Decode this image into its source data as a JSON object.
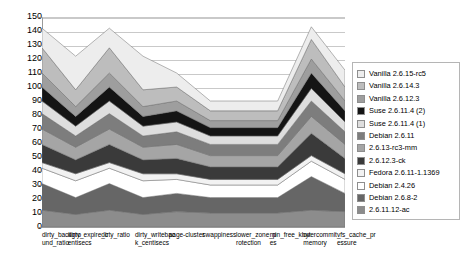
{
  "chart_data": {
    "type": "area",
    "stacked": true,
    "title": "",
    "xlabel": "",
    "ylabel": "",
    "ylim": [
      0,
      150
    ],
    "ytick_step": 10,
    "yticks": [
      0,
      10,
      20,
      30,
      40,
      50,
      60,
      70,
      80,
      90,
      100,
      110,
      120,
      130,
      140,
      150
    ],
    "grid": true,
    "legend_position": "right",
    "categories": [
      "dirty_background_ratio",
      "dirty_expire_centisecs",
      "dirty_ratio",
      "dirty_writeback_centisecs",
      "page-cluster",
      "swappiness",
      "lower_zone_protection",
      "min_free_kbytes",
      "overcommit_memory",
      "vfs_cache_pressure"
    ],
    "series": [
      {
        "name": "2.6.11.12-ac",
        "color": "#8c8c8c",
        "values": [
          12,
          9,
          12,
          9,
          11,
          10,
          10,
          10,
          12,
          11
        ]
      },
      {
        "name": "Debian 2.6.8-2",
        "color": "#666666",
        "values": [
          19,
          12,
          19,
          12,
          13,
          11,
          11,
          11,
          24,
          13
        ]
      },
      {
        "name": "Debian 2.4.26",
        "color": "#ffffff",
        "values": [
          11,
          12,
          11,
          12,
          10,
          9,
          9,
          9,
          11,
          10
        ]
      },
      {
        "name": "Fedora 2.6.11-1.1369",
        "color": "#f2f2f2",
        "values": [
          4,
          5,
          4,
          5,
          4,
          4,
          4,
          4,
          4,
          4
        ]
      },
      {
        "name": "2.6.12.3-ck",
        "color": "#3a3a3a",
        "values": [
          13,
          10,
          13,
          10,
          11,
          9,
          9,
          9,
          16,
          11
        ]
      },
      {
        "name": "2.6.13-rc3-mm",
        "color": "#a5a5a5",
        "values": [
          11,
          9,
          11,
          9,
          10,
          8,
          8,
          8,
          12,
          10
        ]
      },
      {
        "name": "Debian 2.6.11",
        "color": "#7d7d7d",
        "values": [
          11,
          8,
          11,
          8,
          9,
          8,
          8,
          8,
          11,
          9
        ]
      },
      {
        "name": "Suse 2.6.11.4 (1)",
        "color": "#dedede",
        "values": [
          9,
          7,
          9,
          7,
          7,
          6,
          6,
          6,
          9,
          7
        ]
      },
      {
        "name": "Suse 2.6.11.4 (2)",
        "color": "#141414",
        "values": [
          10,
          7,
          10,
          7,
          8,
          6,
          6,
          6,
          11,
          8
        ]
      },
      {
        "name": "Vanilla 2.6.12.3",
        "color": "#9e9e9e",
        "values": [
          10,
          7,
          10,
          7,
          7,
          5,
          5,
          5,
          10,
          7
        ]
      },
      {
        "name": "Vanilla 2.6.14.3",
        "color": "#bdbdbd",
        "values": [
          18,
          12,
          18,
          12,
          10,
          7,
          7,
          7,
          14,
          10
        ]
      },
      {
        "name": "Vanilla 2.6.15-rc5",
        "color": "#ededed",
        "values": [
          14,
          24,
          14,
          24,
          10,
          7,
          7,
          7,
          9,
          12
        ]
      }
    ],
    "legend_entries": [
      "Vanilla 2.6.15-rc5",
      "Vanilla 2.6.14.3",
      "Vanilla 2.6.12.3",
      "Suse 2.6.11.4 (2)",
      "Suse 2.6.11.4 (1)",
      "Debian 2.6.11",
      "2.6.13-rc3-mm",
      "2.6.12.3-ck",
      "Fedora 2.6.11-1.1369",
      "Debian 2.4.26",
      "Debian 2.6.8-2",
      "2.6.11.12-ac"
    ]
  }
}
